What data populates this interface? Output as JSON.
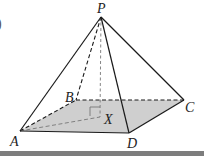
{
  "figure": {
    "colors": {
      "line": "#1a1a1a",
      "base_fill": "#cfcfcf",
      "bottom_bar": "#7d7d7d"
    },
    "vertices": {
      "P": {
        "label": "P",
        "x": 101,
        "y": 17
      },
      "A": {
        "label": "A",
        "x": 20,
        "y": 131
      },
      "B": {
        "label": "B",
        "x": 76,
        "y": 100
      },
      "C": {
        "label": "C",
        "x": 184,
        "y": 100
      },
      "D": {
        "label": "D",
        "x": 129,
        "y": 133
      },
      "X": {
        "label": "X",
        "x": 100,
        "y": 117
      }
    },
    "solid_edges": [
      "PA",
      "PC",
      "PD",
      "AD",
      "DC"
    ],
    "dashed_edges": [
      "PB",
      "PX",
      "AB",
      "BC",
      "AX"
    ],
    "annotations": {
      "right_angle_at": "X",
      "edge_glyph": ")"
    }
  }
}
